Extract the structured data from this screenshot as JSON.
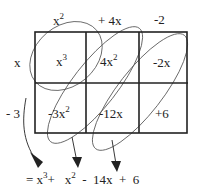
{
  "top_factors": [
    {
      "coef": "x",
      "exp": "2"
    },
    {
      "coef": "+ 4x",
      "exp": ""
    },
    {
      "coef": "-2",
      "exp": ""
    }
  ],
  "side_factors": [
    "x",
    "- 3"
  ],
  "cells": [
    [
      {
        "coef": "x",
        "exp": "3"
      },
      {
        "coef": "4x",
        "exp": "2"
      },
      {
        "coef": "-2x",
        "exp": ""
      }
    ],
    [
      {
        "coef": "-3x",
        "exp": "2"
      },
      {
        "coef": "-12x",
        "exp": ""
      },
      {
        "coef": "+6",
        "exp": ""
      }
    ]
  ],
  "result": {
    "prefix": "= x",
    "t1_exp": "3",
    "t2": "+   x",
    "t2_exp": "2",
    "t3": "-  14x  +  6"
  },
  "colors": {
    "line": "#222222",
    "ellipse": "#555555"
  }
}
